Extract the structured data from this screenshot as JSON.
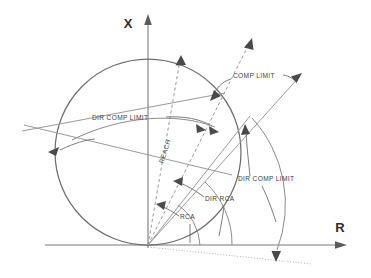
{
  "diagram": {
    "axes": {
      "x_axis_label": "X",
      "r_axis_label": "R",
      "origin_x": 148,
      "origin_y": 245
    },
    "colors": {
      "line": "#9a9a9a",
      "circle": "#6e6e6e",
      "text": "#3d3d3d",
      "arrow": "#4a4a4a",
      "background": "#ffffff"
    },
    "circle": {
      "center_x": 148,
      "center_y": 152,
      "radius": 93
    },
    "labels": [
      {
        "id": "comp-limit",
        "text": "COMP LIMIT",
        "x": 233,
        "y": 78,
        "anchor": "start"
      },
      {
        "id": "dir-comp-limit-left",
        "text": "DIR COMP LIMIT",
        "x": 92,
        "y": 120,
        "anchor": "start"
      },
      {
        "id": "dir-comp-limit-right",
        "text": "DIR COMP LIMIT",
        "x": 238,
        "y": 181,
        "anchor": "start"
      },
      {
        "id": "reach",
        "text": "REACH",
        "x": 167,
        "y": 152,
        "anchor": "middle",
        "rotate": -72
      },
      {
        "id": "dir-rca",
        "text": "DIR RCA",
        "x": 205,
        "y": 201,
        "anchor": "start"
      },
      {
        "id": "rca",
        "text": "RCA",
        "x": 180,
        "y": 219,
        "anchor": "start"
      }
    ],
    "elements": {
      "circle_characteristic": "mho-circle-through-origin",
      "reach_lines": 2,
      "comparator_limit_lines": 2,
      "angle_arcs": 2,
      "dotted_reference_line": 1
    }
  }
}
